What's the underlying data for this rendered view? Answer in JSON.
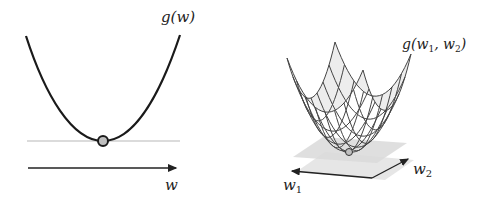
{
  "left_panel": {
    "function_label": "g(w)",
    "axis_label": "w",
    "curve_type": "parabola",
    "minimum_marker": "circle",
    "tangent_line": "horizontal"
  },
  "right_panel": {
    "function_label_prefix": "g(w",
    "function_label_sub1": "1",
    "function_label_mid": ", w",
    "function_label_sub2": "2",
    "function_label_suffix": ")",
    "axis1_label": "w",
    "axis1_sub": "1",
    "axis2_label": "w",
    "axis2_sub": "2",
    "surface_type": "paraboloid wireframe",
    "tangent_plane": "horizontal"
  },
  "colors": {
    "curve": "#1a1a1a",
    "tangent": "#cfcfcf",
    "marker_fill": "#bfbfbf",
    "plane": "#dcdcdc",
    "surface": "#e8e8e8",
    "mesh": "#444444"
  }
}
